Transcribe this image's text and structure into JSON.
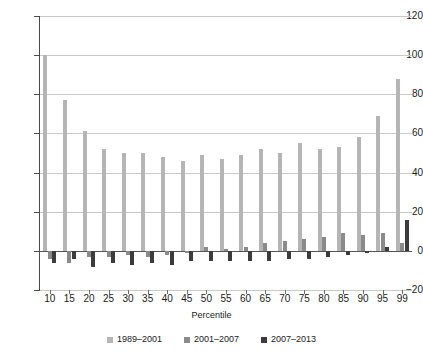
{
  "chart_data": {
    "type": "bar",
    "title": "",
    "subtitle": "",
    "xlabel": "Percentile",
    "ylabel": "",
    "ylim": [
      -20,
      120
    ],
    "yticks": [
      -20,
      0,
      20,
      40,
      60,
      80,
      100,
      120
    ],
    "grid": true,
    "legend_position": "bottom",
    "categories": [
      "10",
      "15",
      "20",
      "25",
      "30",
      "35",
      "40",
      "45",
      "50",
      "55",
      "60",
      "65",
      "70",
      "75",
      "80",
      "85",
      "90",
      "95",
      "99"
    ],
    "series": [
      {
        "name": "1989–2001",
        "color": "#b5b5b5",
        "values": [
          100,
          77,
          61,
          52,
          50,
          50,
          48,
          46,
          49,
          47,
          49,
          52,
          50,
          55,
          52,
          53,
          58,
          69,
          88
        ]
      },
      {
        "name": "2001–2007",
        "color": "#8a8a8a",
        "values": [
          -4,
          -6,
          -3,
          -3,
          -2,
          -3,
          -2,
          -1,
          2,
          1,
          2,
          4,
          5,
          6,
          7,
          9,
          8,
          9,
          4
        ]
      },
      {
        "name": "2007–2013",
        "color": "#3c3c3c",
        "values": [
          -6,
          -4,
          -8,
          -6,
          -7,
          -6,
          -7,
          -5,
          -5,
          -5,
          -5,
          -5,
          -4,
          -4,
          -3,
          -2,
          -1,
          2,
          16
        ]
      }
    ]
  },
  "axes": {
    "y_tick_labels": [
      "120",
      "100",
      "80",
      "60",
      "40",
      "20",
      "0",
      "−20"
    ],
    "x_tick_labels": [
      "10",
      "15",
      "20",
      "25",
      "30",
      "35",
      "40",
      "45",
      "50",
      "55",
      "60",
      "65",
      "70",
      "75",
      "80",
      "85",
      "90",
      "95",
      "99"
    ],
    "x_axis_title": "Percentile"
  },
  "legend": {
    "items": [
      {
        "label": "1989–2001",
        "color": "#b5b5b5"
      },
      {
        "label": "2001–2007",
        "color": "#8a8a8a"
      },
      {
        "label": "2007–2013",
        "color": "#3c3c3c"
      }
    ]
  },
  "colors": {
    "series_1": "#b5b5b5",
    "series_2": "#8a8a8a",
    "series_3": "#3c3c3c",
    "grid": "#c9c9c9",
    "axis": "#4a4a4a",
    "background": "#ffffff"
  }
}
